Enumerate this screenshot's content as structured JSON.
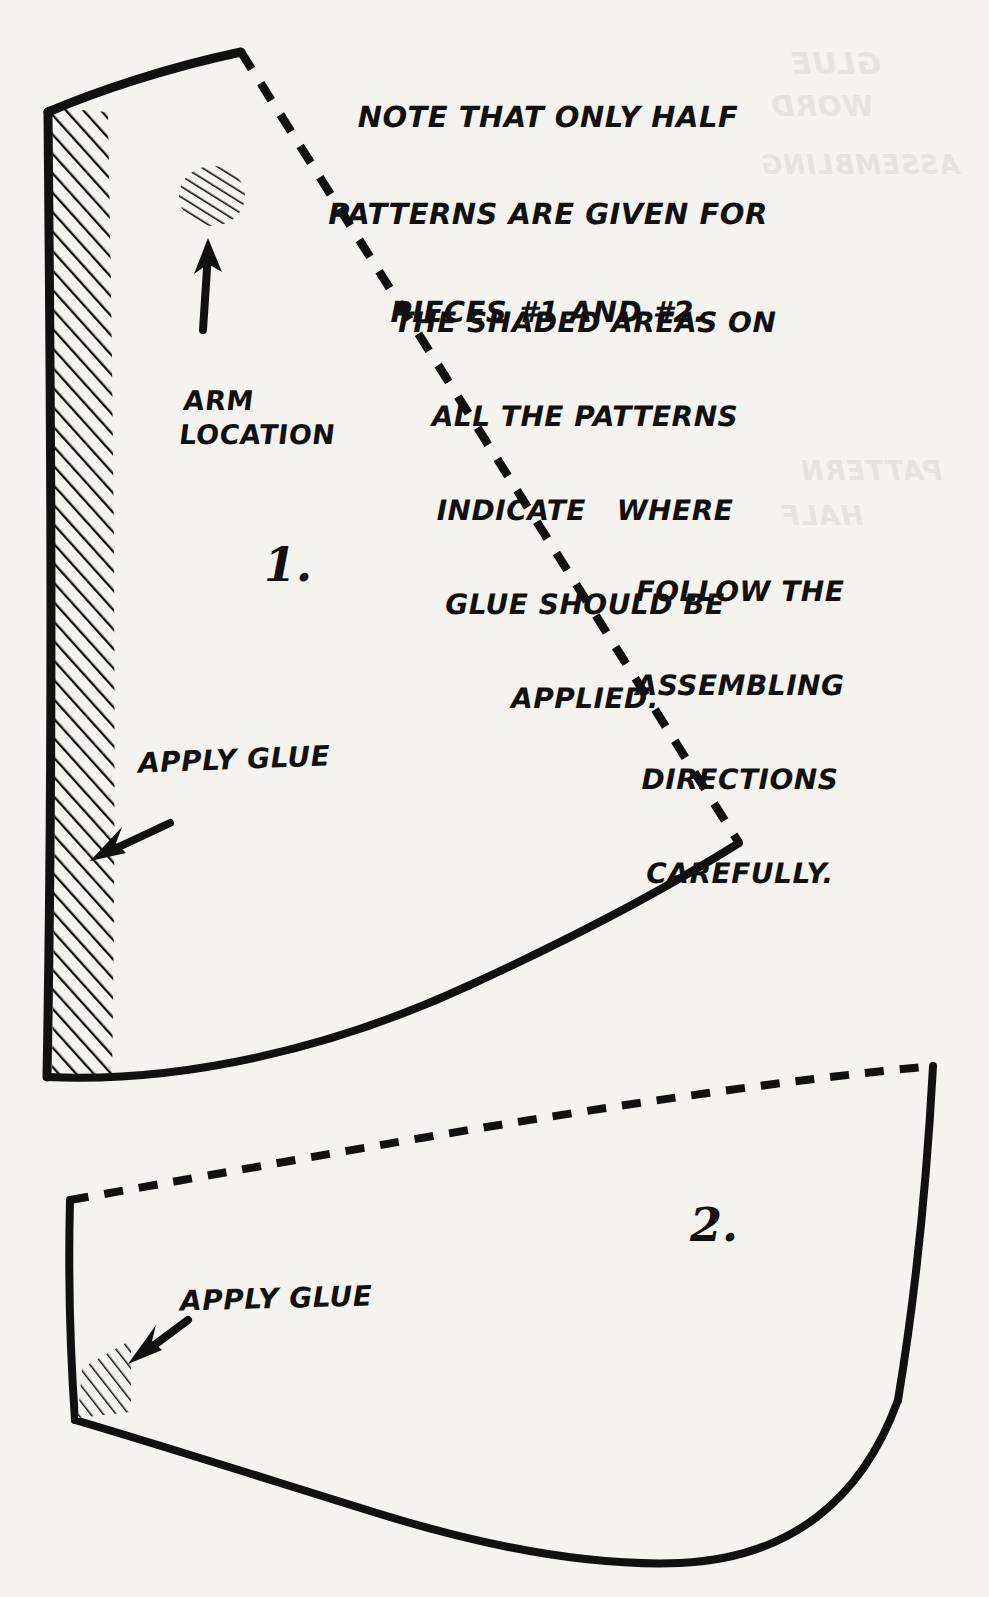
{
  "document": {
    "kind": "craft-pattern-sheet",
    "background_color": "#f4f3ef",
    "ink_color": "#111111",
    "paper_ghost_color": "#d9d7d1"
  },
  "notes": [
    {
      "id": "half-patterns-note",
      "lines": [
        "NOTE THAT ONLY HALF",
        "PATTERNS ARE GIVEN FOR",
        "PIECES #1 AND #2."
      ]
    },
    {
      "id": "shaded-areas-note",
      "lines": [
        "THE SHADED AREAS ON",
        "ALL THE PATTERNS",
        "INDICATE   WHERE",
        "GLUE SHOULD BE",
        "APPLIED."
      ]
    },
    {
      "id": "follow-directions-note",
      "lines": [
        "FOLLOW THE",
        "ASSEMBLING",
        "DIRECTIONS",
        "CAREFULLY."
      ]
    }
  ],
  "callouts": {
    "arm_location": {
      "lines": [
        "ARM",
        "LOCATION"
      ],
      "points_to": "arm-location-glue-spot"
    },
    "apply_glue_piece1": {
      "text": "APPLY GLUE",
      "points_to": "piece1-glue-strip"
    },
    "apply_glue_piece2": {
      "text": "APPLY GLUE",
      "points_to": "piece2-glue-patch"
    }
  },
  "pieces": [
    {
      "id": "piece-1",
      "number_label": "1.",
      "shape": "tapered-wedge",
      "edges": {
        "solid": [
          "top-curve",
          "left-edge",
          "bottom-curve"
        ],
        "dashed": [
          "right-fold-line"
        ]
      },
      "shaded_regions": [
        "left-glue-strip",
        "arm-location-spot"
      ]
    },
    {
      "id": "piece-2",
      "number_label": "2.",
      "shape": "curved-band",
      "edges": {
        "solid": [
          "left-edge",
          "right-edge",
          "bottom-curve"
        ],
        "dashed": [
          "top-fold-line"
        ]
      },
      "shaded_regions": [
        "bottom-left-glue-patch"
      ]
    }
  ],
  "ghost_text": [
    "GLUE",
    "WORD",
    "ASSEMBLING",
    "PATTERN",
    "HALF"
  ]
}
